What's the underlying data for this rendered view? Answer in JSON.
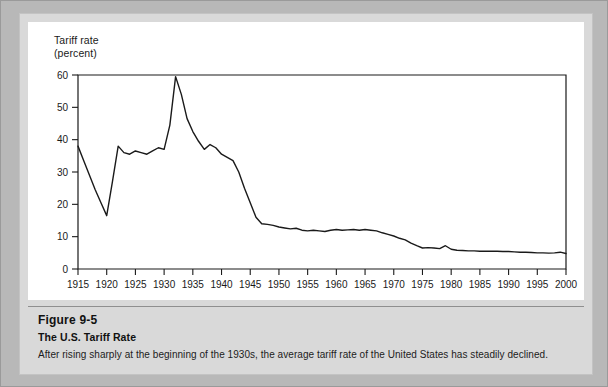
{
  "figure": {
    "number": "Figure 9-5",
    "title": "The U.S. Tariff Rate",
    "caption": "After rising sharply at the beginning of the 1930s, the average tariff rate of the United States has steadily declined."
  },
  "chart_data": {
    "type": "line",
    "title": "The U.S. Tariff Rate",
    "ylabel": "Tariff rate\n(percent)",
    "xlabel": "",
    "xlim": [
      1915,
      2000
    ],
    "ylim": [
      0,
      60
    ],
    "grid": false,
    "legend": null,
    "line_color": "#1a1a1a",
    "xticks": [
      1915,
      1920,
      1925,
      1930,
      1935,
      1940,
      1945,
      1950,
      1955,
      1960,
      1965,
      1970,
      1975,
      1980,
      1985,
      1990,
      1995,
      2000
    ],
    "xtick_labels": [
      "1915",
      "1920",
      "1925",
      "1930",
      "1935",
      "1940",
      "1945",
      "1950",
      "1955",
      "1960",
      "1965",
      "1970",
      "1975",
      "1980",
      "1985",
      "1990",
      "1995",
      "2000"
    ],
    "yticks": [
      0,
      10,
      20,
      30,
      40,
      50,
      60
    ],
    "ytick_labels": [
      "0",
      "10",
      "20",
      "30",
      "40",
      "50",
      "60"
    ],
    "x": [
      1915,
      1916,
      1917,
      1918,
      1919,
      1920,
      1921,
      1922,
      1923,
      1924,
      1925,
      1926,
      1927,
      1928,
      1929,
      1930,
      1931,
      1932,
      1933,
      1934,
      1935,
      1936,
      1937,
      1938,
      1939,
      1940,
      1941,
      1942,
      1943,
      1944,
      1945,
      1946,
      1947,
      1948,
      1949,
      1950,
      1951,
      1952,
      1953,
      1954,
      1955,
      1956,
      1957,
      1958,
      1959,
      1960,
      1961,
      1962,
      1963,
      1964,
      1965,
      1966,
      1967,
      1968,
      1969,
      1970,
      1971,
      1972,
      1973,
      1974,
      1975,
      1976,
      1977,
      1978,
      1979,
      1980,
      1981,
      1982,
      1983,
      1984,
      1985,
      1986,
      1987,
      1988,
      1989,
      1990,
      1991,
      1992,
      1993,
      1994,
      1995,
      1996,
      1997,
      1998,
      1999,
      2000
    ],
    "y": [
      38.0,
      33.5,
      29.0,
      24.5,
      20.5,
      16.5,
      27.0,
      38.0,
      36.0,
      35.5,
      36.5,
      36.0,
      35.5,
      36.5,
      37.5,
      37.0,
      44.5,
      59.5,
      54.0,
      46.5,
      42.5,
      39.5,
      37.0,
      38.5,
      37.5,
      35.5,
      34.5,
      33.5,
      30.0,
      25.0,
      20.5,
      16.0,
      14.0,
      13.8,
      13.5,
      13.0,
      12.7,
      12.4,
      12.6,
      12.0,
      11.8,
      12.0,
      11.8,
      11.6,
      12.0,
      12.2,
      12.0,
      12.1,
      12.2,
      12.0,
      12.2,
      12.0,
      11.8,
      11.2,
      10.7,
      10.2,
      9.5,
      9.0,
      8.0,
      7.2,
      6.5,
      6.6,
      6.5,
      6.3,
      7.2,
      6.1,
      5.8,
      5.7,
      5.6,
      5.6,
      5.5,
      5.5,
      5.5,
      5.5,
      5.4,
      5.4,
      5.3,
      5.2,
      5.2,
      5.1,
      5.0,
      5.0,
      4.9,
      5.0,
      5.2,
      4.8
    ]
  }
}
